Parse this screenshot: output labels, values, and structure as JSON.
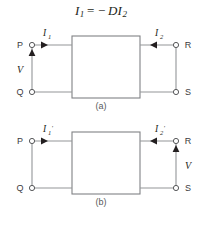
{
  "equation": {
    "lhs_symbol": "I",
    "lhs_sub": "1",
    "operator": "= −",
    "coefficient": "D",
    "rhs_symbol": "I",
    "rhs_sub": "2",
    "full_text": "I₁ = −DI₂"
  },
  "colors": {
    "background": "#ffffff",
    "wire": "#939598",
    "box_outline": "#808285",
    "terminal": "#58595b",
    "arrow": "#231f20",
    "text": "#231f20",
    "caption": "#58595b"
  },
  "figures": [
    {
      "id": "a",
      "caption": "(a)",
      "terminals": {
        "top_left": "P",
        "bottom_left": "Q",
        "top_right": "R",
        "bottom_right": "S"
      },
      "currents": {
        "left": {
          "symbol": "I",
          "sub": "1",
          "prime": "",
          "arrow_direction": "right"
        },
        "right": {
          "symbol": "I",
          "sub": "2",
          "prime": "",
          "arrow_direction": "left"
        }
      },
      "voltage": {
        "label": "V",
        "side": "left",
        "arrow_direction": "up"
      },
      "network_box_label": ""
    },
    {
      "id": "b",
      "caption": "(b)",
      "terminals": {
        "top_left": "P",
        "bottom_left": "Q",
        "top_right": "R",
        "bottom_right": "S"
      },
      "currents": {
        "left": {
          "symbol": "I",
          "sub": "1",
          "prime": "′",
          "arrow_direction": "right"
        },
        "right": {
          "symbol": "I",
          "sub": "2",
          "prime": "′",
          "arrow_direction": "left"
        }
      },
      "voltage": {
        "label": "V",
        "side": "right",
        "arrow_direction": "up"
      },
      "network_box_label": ""
    }
  ]
}
